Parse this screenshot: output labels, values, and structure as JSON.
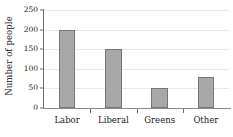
{
  "chart_data": {
    "type": "bar",
    "title": "",
    "subtitle": "",
    "xlabel": "",
    "ylabel": "Number of people",
    "categories": [
      "Labor",
      "Liberal",
      "Greens",
      "Other"
    ],
    "values": [
      200,
      150,
      50,
      80
    ],
    "series": [
      {
        "name": "Number of people",
        "values": [
          200,
          150,
          50,
          80
        ]
      }
    ],
    "ylim": [
      0,
      250
    ],
    "yticks": [
      0,
      50,
      100,
      150,
      200,
      250
    ],
    "ytick_labels": [
      "0",
      "50",
      "100",
      "150",
      "200",
      "250"
    ],
    "xtick_labels": [
      "Labor",
      "Liberal",
      "Greens",
      "Other"
    ],
    "grid": true,
    "grid_axis": "y",
    "legend": false,
    "legend_position": "none",
    "annotations": [],
    "colors": {
      "bar_fill": "#a8a8a8",
      "bar_border": "#767676",
      "gridline": "#e9e9e9",
      "axis": "#6f6f6f",
      "baseline": "#8a8a8a",
      "text": "#1a1a1a",
      "background": "#ffffff"
    }
  }
}
